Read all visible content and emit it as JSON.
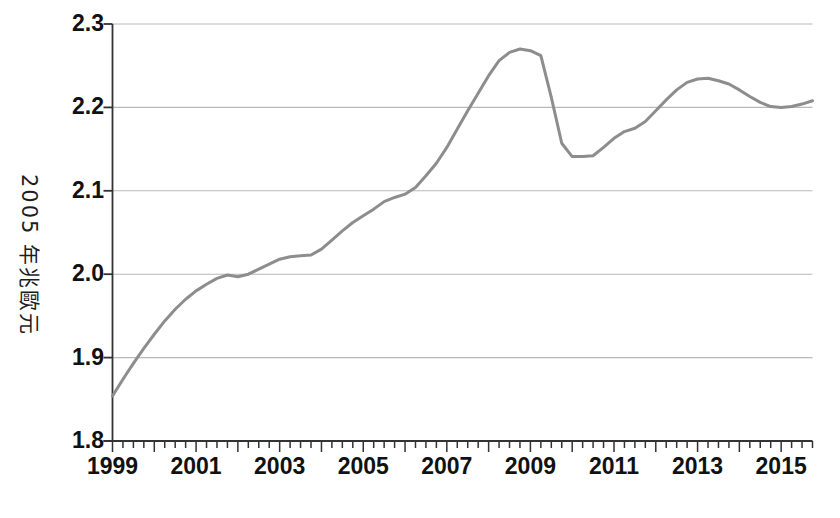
{
  "chart_data": {
    "type": "line",
    "title": "",
    "subtitle": "",
    "xlabel": "",
    "ylabel": "2005 年兆歐元",
    "xlim": [
      1999.0,
      2015.75
    ],
    "ylim": [
      1.8,
      2.3
    ],
    "grid": true,
    "legend": "none",
    "line_color": "#8d8d8d",
    "axis_color": "#333333",
    "grid_color": "#b9b9b9",
    "background_color": "#ffffff",
    "y_ticks": [
      "1.8",
      "1.9",
      "2.0",
      "2.1",
      "2.2",
      "2.3"
    ],
    "y_tick_values": [
      1.8,
      1.9,
      2.0,
      2.1,
      2.2,
      2.3
    ],
    "x_ticks": [
      "1999",
      "2001",
      "2003",
      "2005",
      "2007",
      "2009",
      "2011",
      "2013",
      "2015"
    ],
    "x_tick_values": [
      1999,
      2001,
      2003,
      2005,
      2007,
      2009,
      2011,
      2013,
      2015
    ],
    "x_minor_tick_interval": 0.25,
    "x_minor_tick_label": "quarterly",
    "series": [
      {
        "name": "2005 年兆歐元",
        "color": "#8d8d8d",
        "x": [
          1999.0,
          1999.25,
          1999.5,
          1999.75,
          2000.0,
          2000.25,
          2000.5,
          2000.75,
          2001.0,
          2001.25,
          2001.5,
          2001.75,
          2002.0,
          2002.25,
          2002.5,
          2002.75,
          2003.0,
          2003.25,
          2003.5,
          2003.75,
          2004.0,
          2004.25,
          2004.5,
          2004.75,
          2005.0,
          2005.25,
          2005.5,
          2005.75,
          2006.0,
          2006.25,
          2006.5,
          2006.75,
          2007.0,
          2007.25,
          2007.5,
          2007.75,
          2008.0,
          2008.25,
          2008.5,
          2008.75,
          2009.0,
          2009.25,
          2009.5,
          2009.75,
          2010.0,
          2010.25,
          2010.5,
          2010.75,
          2011.0,
          2011.25,
          2011.5,
          2011.75,
          2012.0,
          2012.25,
          2012.5,
          2012.75,
          2013.0,
          2013.25,
          2013.5,
          2013.75,
          2014.0,
          2014.25,
          2014.5,
          2014.75,
          2015.0,
          2015.25,
          2015.5,
          2015.75
        ],
        "values": [
          1.854,
          1.874,
          1.893,
          1.911,
          1.928,
          1.944,
          1.958,
          1.97,
          1.98,
          1.988,
          1.995,
          1.999,
          1.997,
          2.0,
          2.006,
          2.012,
          2.018,
          2.021,
          2.022,
          2.023,
          2.03,
          2.041,
          2.052,
          2.062,
          2.07,
          2.078,
          2.087,
          2.092,
          2.096,
          2.104,
          2.118,
          2.133,
          2.152,
          2.174,
          2.196,
          2.217,
          2.238,
          2.256,
          2.266,
          2.27,
          2.268,
          2.262,
          2.212,
          2.157,
          2.141,
          2.141,
          2.142,
          2.152,
          2.163,
          2.171,
          2.175,
          2.183,
          2.196,
          2.209,
          2.221,
          2.23,
          2.234,
          2.235,
          2.232,
          2.228,
          2.221,
          2.213,
          2.206,
          2.201,
          2.2,
          2.201,
          2.204,
          2.208
        ]
      }
    ],
    "annotations": {
      "peak": {
        "x": 2008.75,
        "y": 2.27,
        "note": "pre-crisis peak"
      },
      "trough": {
        "x": 2010.25,
        "y": 2.141,
        "note": "post-crisis trough"
      },
      "end": {
        "x": 2015.75,
        "y": 2.251,
        "note": "final value"
      }
    },
    "tail_x": [
      2015.0,
      2015.25,
      2015.5,
      2015.75
    ],
    "tail_values": [
      2.215,
      2.228,
      2.24,
      2.251
    ]
  },
  "axes": {
    "y_title": "2005 年兆歐元",
    "y_tick_labels": [
      "2.3",
      "2.2",
      "2.1",
      "2.0",
      "1.9",
      "1.8"
    ],
    "x_tick_labels": [
      "1999",
      "2001",
      "2003",
      "2005",
      "2007",
      "2009",
      "2011",
      "2013",
      "2015"
    ]
  }
}
